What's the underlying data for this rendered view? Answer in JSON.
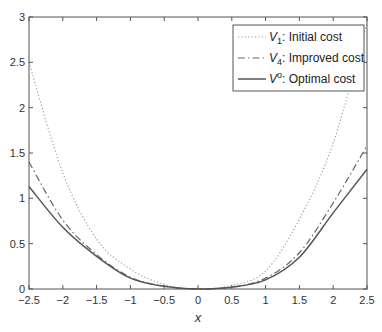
{
  "chart_data": {
    "type": "line",
    "title": "",
    "xlabel": "x",
    "ylabel": "",
    "xlim": [
      -2.5,
      2.5
    ],
    "ylim": [
      0,
      3
    ],
    "xticks": [
      -2.5,
      -2,
      -1.5,
      -1,
      -0.5,
      0,
      0.5,
      1,
      1.5,
      2,
      2.5
    ],
    "xtick_labels": [
      "−2.5",
      "−2",
      "−1.5",
      "−1",
      "−0.5",
      "0",
      "0.5",
      "1",
      "1.5",
      "2",
      "2.5"
    ],
    "yticks": [
      0,
      0.5,
      1,
      1.5,
      2,
      2.5,
      3
    ],
    "ytick_labels": [
      "0",
      "0.5",
      "1",
      "1.5",
      "2",
      "2.5",
      "3"
    ],
    "grid": false,
    "legend_position": "upper right",
    "x": [
      -2.5,
      -2,
      -1.5,
      -1,
      -0.5,
      0,
      0.5,
      1,
      1.5,
      2,
      2.5
    ],
    "series": [
      {
        "name": "V1: Initial cost",
        "symbol": "V",
        "subscript": "1",
        "superscript": "",
        "desc": ": Initial cost",
        "style": "dotted",
        "color": "#9a9a9a",
        "values": [
          2.5,
          1.28,
          0.55,
          0.22,
          0.05,
          0.0,
          0.04,
          0.2,
          0.77,
          1.61,
          2.93
        ]
      },
      {
        "name": "V4: Improved cost",
        "symbol": "V",
        "subscript": "4",
        "superscript": "",
        "desc": ": Improved cost",
        "style": "dashdot",
        "color": "#666666",
        "values": [
          1.4,
          0.76,
          0.38,
          0.13,
          0.03,
          0.0,
          0.02,
          0.12,
          0.4,
          0.95,
          1.58
        ]
      },
      {
        "name": "Vo: Optimal cost",
        "symbol": "V",
        "subscript": "",
        "superscript": "o",
        "desc": ": Optimal cost",
        "style": "solid",
        "color": "#555555",
        "values": [
          1.13,
          0.68,
          0.36,
          0.12,
          0.03,
          0.0,
          0.02,
          0.1,
          0.35,
          0.84,
          1.32
        ]
      }
    ]
  },
  "colors": {
    "axis": "#555555",
    "text": "#333333",
    "background": "#ffffff"
  }
}
